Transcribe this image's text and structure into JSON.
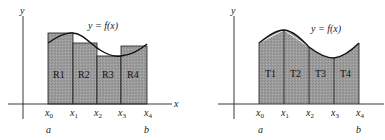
{
  "figures": [
    {
      "id": "riemann-rectangles",
      "axis_labels": {
        "x": "x",
        "y": "y"
      },
      "curve_label": "y = f(x)",
      "partition_labels": [
        "x0",
        "x1",
        "x2",
        "x3",
        "x4"
      ],
      "endpoint_labels": {
        "a": "a",
        "b": "b"
      },
      "region_labels": [
        "R1",
        "R2",
        "R3",
        "R4"
      ]
    },
    {
      "id": "trapezoids",
      "axis_labels": {
        "x": "x",
        "y": "y"
      },
      "curve_label": "y = f(x)",
      "partition_labels": [
        "x0",
        "x1",
        "x2",
        "x3",
        "x4"
      ],
      "endpoint_labels": {
        "a": "a",
        "b": "b"
      },
      "region_labels": [
        "T1",
        "T2",
        "T3",
        "T4"
      ]
    }
  ],
  "colors": {
    "fill": "#9a9a9a",
    "line": "#1a1a1a",
    "background": "#ffffff"
  }
}
